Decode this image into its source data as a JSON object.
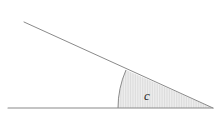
{
  "figure": {
    "name": "angle-sector-diagram",
    "background_color": "#ffffff",
    "width": 218,
    "height": 119,
    "line_color": "#8a8a8a",
    "baseline": {
      "name": "horizontal-baseline",
      "x1": 8,
      "y1": 108,
      "x2": 213,
      "y2": 108,
      "stroke_width": 1.1
    },
    "ray": {
      "name": "diagonal-ray",
      "x1": 24,
      "y1": 22,
      "x2": 213,
      "y2": 108,
      "stroke_width": 1.0
    },
    "sector": {
      "name": "shaded-angle-sector",
      "vertex_x": 213,
      "vertex_y": 108,
      "arc_start_x": 126,
      "arc_start_y": 70,
      "arc_end_x": 118,
      "arc_end_y": 108,
      "arc_radius": 95,
      "fill_color": "#dcdcdc",
      "hatch_color": "#ffffff",
      "hatch_spacing": 1.7,
      "stroke_color": "#8a8a8a"
    },
    "label": {
      "name": "angle-label-c",
      "text": "c",
      "x": 147,
      "y": 100,
      "color": "#2b2b2b",
      "font_size": 13,
      "style": "italic"
    }
  }
}
